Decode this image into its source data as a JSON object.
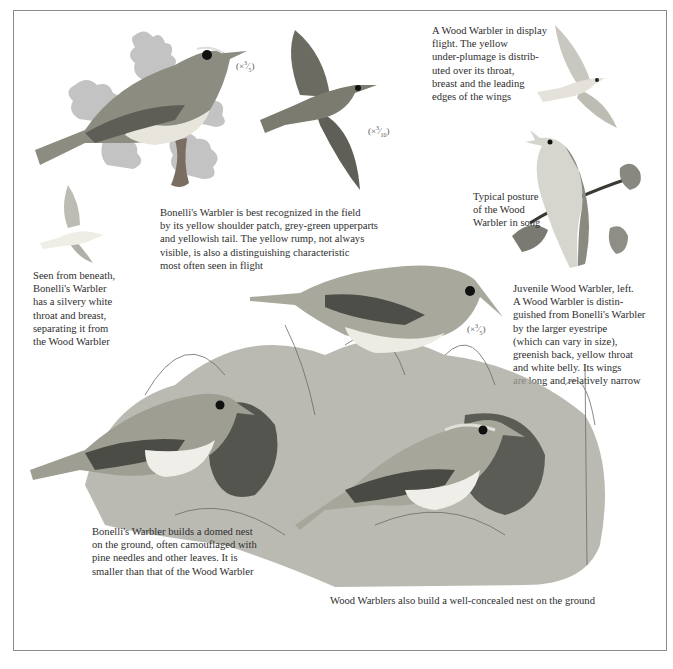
{
  "page": {
    "captions": {
      "display_flight": "A Wood Warbler in display\nflight. The yellow\nunder-plumage is distrib-\nuted over its throat,\nbreast and the leading\nedges of the wings",
      "bonelli_field": "Bonelli's Warbler is best recognized in the field\nby its yellow shoulder patch, grey-green upperparts\nand yellowish tail. The yellow rump, not always\nvisible, is also a distinguishing characteristic\nmost often seen in flight",
      "seen_beneath": "Seen from beneath,\nBonelli's Warbler\nhas a silvery white\nthroat and breast,\nseparating it from\nthe Wood Warbler",
      "song_posture": "Typical posture\nof the Wood\nWarbler in song",
      "juvenile": "Juvenile Wood Warbler, left.\nA Wood Warbler is distin-\nguished from Bonelli's Warbler\nby the larger eyestripe\n(which can vary in size),\ngreenish back, yellow throat\nand white belly. Its wings\nare long and relatively narrow",
      "bonelli_nest": "Bonelli's Warbler builds a domed nest\non the ground, often camouflaged with\npine needles and other leaves. It is\nsmaller than that of the Wood Warbler",
      "wood_nest": "Wood Warblers also build a well-concealed nest on the ground"
    },
    "scales": {
      "perched_bonelli": {
        "prefix": "(×",
        "num": "3",
        "den": "5",
        "suffix": ")"
      },
      "flying_bonelli": {
        "prefix": "(×",
        "num": "3",
        "den": "10",
        "suffix": ")"
      },
      "juvenile_wood": {
        "prefix": "(×",
        "num": "3",
        "den": "5",
        "suffix": ")"
      }
    },
    "illustrations": [
      "bonelli-warbler-perched-on-oak",
      "bonelli-warbler-in-flight-above",
      "wood-warbler-display-flight",
      "bonelli-warbler-from-beneath",
      "wood-warbler-singing-on-branch",
      "juvenile-wood-warbler-on-nest",
      "bonelli-warbler-at-domed-nest",
      "wood-warbler-at-ground-nest"
    ]
  }
}
